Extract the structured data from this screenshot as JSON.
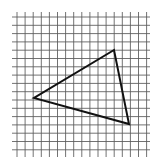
{
  "diagram": {
    "type": "triangle-on-grid",
    "grid": {
      "columns": 17,
      "rows": 17,
      "x_start": 17,
      "y_start": 17,
      "spacing_x": 8.1,
      "spacing_y": 8.3,
      "v_line_top": 12,
      "v_line_bottom": 157,
      "h_line_left": 12,
      "h_line_right": 150,
      "line_color": "#5a5a5a"
    },
    "triangle": {
      "vertices": [
        {
          "label": "top",
          "x": 114,
          "y": 50
        },
        {
          "label": "left",
          "x": 34,
          "y": 98
        },
        {
          "label": "bottom-right",
          "x": 129,
          "y": 124
        }
      ],
      "stroke_color": "#111111"
    }
  }
}
